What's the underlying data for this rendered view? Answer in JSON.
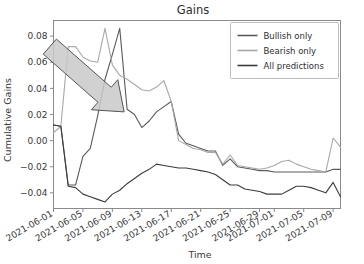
{
  "chart_data": {
    "type": "line",
    "title": "Gains",
    "xlabel": "Time",
    "ylabel": "Cumulative Gains",
    "grid": false,
    "legend_position": "upper right",
    "ylim": [
      -0.052,
      0.092
    ],
    "yticks": [
      0.08,
      0.06,
      0.04,
      0.02,
      0.0,
      -0.02,
      -0.04
    ],
    "ytick_labels": [
      "0.08",
      "0.06",
      "0.04",
      "0.02",
      "0.00",
      "−0.02",
      "−0.04"
    ],
    "xtick_labels": [
      "2021-06-01",
      "2021-06-05",
      "2021-06-09",
      "2021-06-13",
      "2021-06-17",
      "2021-06-21",
      "2021-06-25",
      "2021-06-29",
      "2021-07-01",
      "2021-07-05",
      "2021-07-09"
    ],
    "xtick_positions": [
      0,
      4,
      8,
      12,
      16,
      20,
      24,
      28,
      30,
      34,
      38
    ],
    "xlim": [
      0,
      39
    ],
    "x": [
      0,
      1,
      2,
      3,
      4,
      5,
      6,
      7,
      8,
      9,
      10,
      11,
      12,
      13,
      14,
      15,
      16,
      17,
      18,
      19,
      20,
      21,
      22,
      23,
      24,
      25,
      26,
      27,
      28,
      29,
      30,
      31,
      32,
      33,
      34,
      35,
      36,
      37,
      38,
      39
    ],
    "series": [
      {
        "name": "Bullish only",
        "color": "#5a5a5a",
        "values": [
          0.012,
          0.011,
          -0.034,
          -0.034,
          -0.012,
          -0.006,
          0.019,
          0.047,
          0.066,
          0.086,
          0.024,
          0.02,
          0.01,
          0.015,
          0.022,
          0.026,
          0.03,
          0.005,
          -0.002,
          -0.004,
          -0.006,
          -0.008,
          -0.008,
          -0.019,
          -0.014,
          -0.02,
          -0.021,
          -0.022,
          -0.023,
          -0.023,
          -0.024,
          -0.024,
          -0.024,
          -0.024,
          -0.024,
          -0.024,
          -0.024,
          -0.024,
          -0.022,
          -0.022
        ]
      },
      {
        "name": "Bearish only",
        "color": "#a8a8a8",
        "values": [
          0.006,
          0.011,
          0.072,
          0.072,
          0.064,
          0.061,
          0.06,
          0.086,
          0.058,
          0.05,
          0.047,
          0.043,
          0.039,
          0.038,
          0.041,
          0.046,
          0.03,
          0.0,
          -0.003,
          -0.006,
          -0.007,
          -0.009,
          -0.009,
          -0.018,
          -0.011,
          -0.019,
          -0.02,
          -0.021,
          -0.022,
          -0.021,
          -0.019,
          -0.016,
          -0.015,
          -0.018,
          -0.02,
          -0.022,
          -0.023,
          -0.024,
          0.002,
          -0.005
        ]
      },
      {
        "name": "All predictions",
        "color": "#3c3c3c",
        "values": [
          0.012,
          0.011,
          -0.035,
          -0.036,
          -0.041,
          -0.043,
          -0.045,
          -0.047,
          -0.041,
          -0.038,
          -0.033,
          -0.029,
          -0.025,
          -0.022,
          -0.018,
          -0.019,
          -0.02,
          -0.021,
          -0.021,
          -0.022,
          -0.023,
          -0.024,
          -0.026,
          -0.03,
          -0.034,
          -0.034,
          -0.037,
          -0.038,
          -0.039,
          -0.041,
          -0.041,
          -0.041,
          -0.038,
          -0.035,
          -0.035,
          -0.036,
          -0.038,
          -0.04,
          -0.032,
          -0.043
        ]
      }
    ],
    "annotations": [
      {
        "type": "arrow",
        "name": "trend-arrow",
        "color": "#c9c9c9",
        "edge_color": "#555555",
        "from": [
          -0.5,
          0.072
        ],
        "to": [
          9.6,
          0.022
        ]
      }
    ]
  }
}
